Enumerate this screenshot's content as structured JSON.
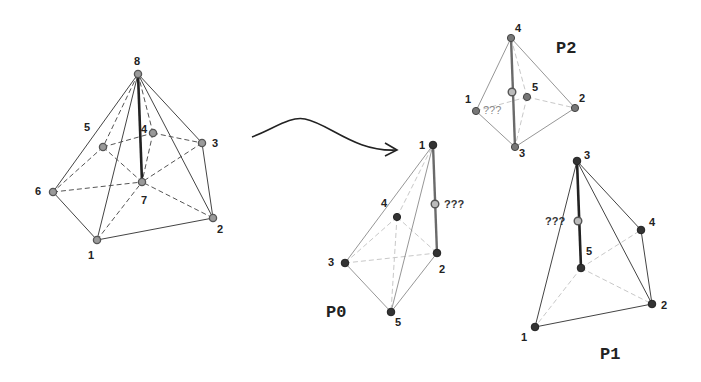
{
  "diagram": {
    "type": "mesh-partition-illustration",
    "arrow": {
      "from": "original-pyramid",
      "to": "partitions"
    },
    "original": {
      "name": "original-pyramid",
      "nodes": [
        {
          "id": "1",
          "label": "1",
          "x": 97,
          "y": 240,
          "lx": 88,
          "ly": 259
        },
        {
          "id": "2",
          "label": "2",
          "x": 213,
          "y": 218,
          "lx": 217,
          "ly": 233
        },
        {
          "id": "3",
          "label": "3",
          "x": 202,
          "y": 143,
          "lx": 212,
          "ly": 147
        },
        {
          "id": "4",
          "label": "4",
          "x": 153,
          "y": 133,
          "lx": 141,
          "ly": 133
        },
        {
          "id": "5",
          "label": "5",
          "x": 103,
          "y": 147,
          "lx": 84,
          "ly": 131
        },
        {
          "id": "6",
          "label": "6",
          "x": 53,
          "y": 192,
          "lx": 35,
          "ly": 195
        },
        {
          "id": "7",
          "label": "7",
          "x": 142,
          "y": 182,
          "lx": 141,
          "ly": 204
        },
        {
          "id": "8",
          "label": "8",
          "x": 138,
          "y": 74,
          "lx": 134,
          "ly": 65
        }
      ]
    },
    "partitions": [
      {
        "name": "P0",
        "label": "P0",
        "label_x": 326,
        "label_y": 317,
        "nodes": [
          {
            "id": "1",
            "label": "1",
            "x": 433,
            "y": 145,
            "lx": 419,
            "ly": 149
          },
          {
            "id": "2",
            "label": "2",
            "x": 437,
            "y": 253,
            "lx": 439,
            "ly": 273
          },
          {
            "id": "3",
            "label": "3",
            "x": 345,
            "y": 263,
            "lx": 328,
            "ly": 266
          },
          {
            "id": "4",
            "label": "4",
            "x": 397,
            "y": 217,
            "lx": 381,
            "ly": 207
          },
          {
            "id": "5",
            "label": "5",
            "x": 391,
            "y": 312,
            "lx": 395,
            "ly": 326
          },
          {
            "id": "q",
            "label": "???",
            "x": 435,
            "y": 204,
            "lx": 444,
            "ly": 208
          }
        ]
      },
      {
        "name": "P1",
        "label": "P1",
        "label_x": 600,
        "label_y": 359,
        "nodes": [
          {
            "id": "1",
            "label": "1",
            "x": 535,
            "y": 327,
            "lx": 521,
            "ly": 341
          },
          {
            "id": "2",
            "label": "2",
            "x": 652,
            "y": 304,
            "lx": 661,
            "ly": 309
          },
          {
            "id": "3",
            "label": "3",
            "x": 577,
            "y": 161,
            "lx": 584,
            "ly": 159
          },
          {
            "id": "4",
            "label": "4",
            "x": 641,
            "y": 230,
            "lx": 649,
            "ly": 226
          },
          {
            "id": "5",
            "label": "5",
            "x": 581,
            "y": 268,
            "lx": 586,
            "ly": 255
          },
          {
            "id": "q",
            "label": "???",
            "x": 578,
            "y": 221,
            "lx": 545,
            "ly": 225
          }
        ]
      },
      {
        "name": "P2",
        "label": "P2",
        "label_x": 556,
        "label_y": 53,
        "nodes": [
          {
            "id": "1",
            "label": "1",
            "x": 476,
            "y": 111,
            "lx": 465,
            "ly": 103
          },
          {
            "id": "2",
            "label": "2",
            "x": 575,
            "y": 108,
            "lx": 579,
            "ly": 102
          },
          {
            "id": "3",
            "label": "3",
            "x": 515,
            "y": 147,
            "lx": 519,
            "ly": 157
          },
          {
            "id": "4",
            "label": "4",
            "x": 511,
            "y": 38,
            "lx": 515,
            "ly": 32
          },
          {
            "id": "5",
            "label": "5",
            "x": 527,
            "y": 97,
            "lx": 532,
            "ly": 91
          },
          {
            "id": "q",
            "label": "???",
            "x": 512,
            "y": 92,
            "lx": 483,
            "ly": 114
          }
        ]
      }
    ]
  }
}
